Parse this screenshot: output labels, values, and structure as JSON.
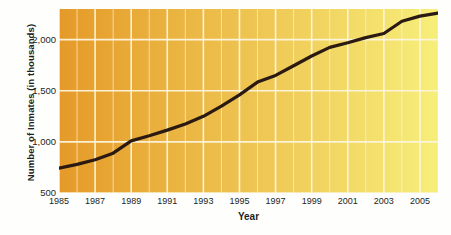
{
  "chart_data": {
    "type": "line",
    "title": "",
    "xlabel": "Year",
    "ylabel": "Number of Inmates (in thousands)",
    "xlim": [
      1985,
      2006
    ],
    "ylim": [
      500,
      2300
    ],
    "grid": true,
    "legend": "none",
    "accent_color": "#2b1a12",
    "gradient_start": "#e59a28",
    "gradient_end": "#f7ee7a",
    "gridline_color": "#fdf6e0",
    "y_ticks": [
      500,
      1000,
      1500,
      2000
    ],
    "y_tick_labels": [
      "500",
      "1,000",
      "1,500",
      "2,000"
    ],
    "x_ticks": [
      1985,
      1987,
      1989,
      1991,
      1993,
      1995,
      1997,
      1999,
      2001,
      2003,
      2005
    ],
    "x_tick_labels": [
      "1985",
      "1987",
      "1989",
      "1991",
      "1993",
      "1995",
      "1997",
      "1999",
      "2001",
      "2003",
      "2005"
    ],
    "x": [
      1985,
      1986,
      1987,
      1988,
      1989,
      1990,
      1991,
      1992,
      1993,
      1994,
      1995,
      1996,
      1997,
      1998,
      1999,
      2000,
      2001,
      2002,
      2003,
      2004,
      2005,
      2006
    ],
    "values": [
      744,
      780,
      825,
      890,
      1010,
      1060,
      1115,
      1175,
      1250,
      1350,
      1460,
      1585,
      1650,
      1745,
      1840,
      1925,
      1970,
      2020,
      2060,
      2180,
      2230,
      2260
    ],
    "series": [
      {
        "name": "Number of Inmates",
        "values": [
          744,
          780,
          825,
          890,
          1010,
          1060,
          1115,
          1175,
          1250,
          1350,
          1460,
          1585,
          1650,
          1745,
          1840,
          1925,
          1970,
          2020,
          2060,
          2180,
          2230,
          2260
        ]
      }
    ]
  },
  "axes": {
    "y_title": "Number of Inmates (in thousands)",
    "x_title": "Year"
  }
}
